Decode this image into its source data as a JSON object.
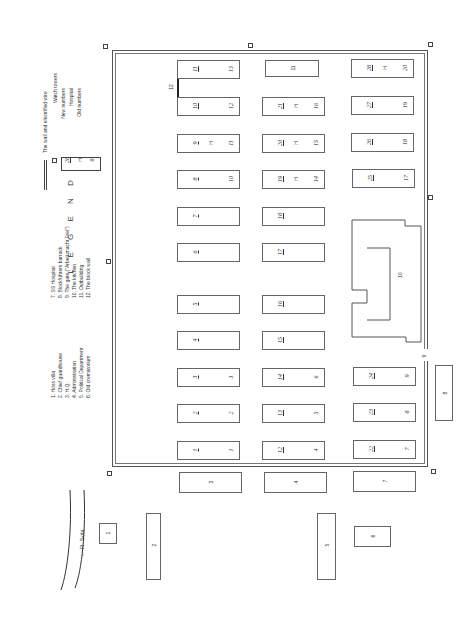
{
  "map": {
    "title": "L E G E N D",
    "river_label": "← R. Sola",
    "legend_items_left": [
      "1. Höss villa",
      "2. Chief guardhouse",
      "3. H.Q.",
      "4. Administration",
      "5. Political Department",
      "6. Old crematorium"
    ],
    "legend_items_right": [
      "7. SS Hospital",
      "8. Blockführers barrack",
      "9. The gate (\"Arbeit macht Frei\")",
      "10. The kitchen",
      "11. Outbuilding",
      "12. The block wall"
    ],
    "legend_symbols": {
      "wall": "The wall and electrified wire",
      "towers": "Watch towers",
      "new_numbers": "New numbers",
      "hospital": "Hospital",
      "old_numbers": "Old numbers",
      "sample_new": "28",
      "sample_h": "H",
      "sample_old": "8"
    },
    "camp_blocks": [
      {
        "new": "11",
        "old": "13",
        "h": ""
      },
      {
        "new": "10",
        "old": "12",
        "h": ""
      },
      {
        "new": "9",
        "old": "11",
        "h": "H"
      },
      {
        "new": "8",
        "old": "10",
        "h": ""
      },
      {
        "new": "7",
        "old": "",
        "h": ""
      },
      {
        "new": "6",
        "old": "",
        "h": ""
      },
      {
        "new": "5",
        "old": "",
        "h": ""
      },
      {
        "new": "4",
        "old": "",
        "h": ""
      },
      {
        "new": "3",
        "old": "3",
        "h": ""
      },
      {
        "new": "2",
        "old": "2",
        "h": ""
      },
      {
        "new": "1",
        "old": "1",
        "h": ""
      },
      {
        "new": "",
        "old": "",
        "h": "",
        "label": "11"
      },
      {
        "new": "21",
        "old": "16",
        "h": "H"
      },
      {
        "new": "20",
        "old": "15",
        "h": "H"
      },
      {
        "new": "19",
        "old": "14",
        "h": "H"
      },
      {
        "new": "18",
        "old": "",
        "h": ""
      },
      {
        "new": "17",
        "old": "",
        "h": ""
      },
      {
        "new": "16",
        "old": "",
        "h": ""
      },
      {
        "new": "15",
        "old": "",
        "h": ""
      },
      {
        "new": "14",
        "old": "6",
        "h": ""
      },
      {
        "new": "13",
        "old": "5",
        "h": ""
      },
      {
        "new": "12",
        "old": "4",
        "h": ""
      },
      {
        "new": "28",
        "old": "20",
        "h": "H"
      },
      {
        "new": "27",
        "old": "19",
        "h": ""
      },
      {
        "new": "26",
        "old": "18",
        "h": ""
      },
      {
        "new": "25",
        "old": "17",
        "h": ""
      },
      {
        "new": "24",
        "old": "9",
        "h": ""
      },
      {
        "new": "23",
        "old": "8",
        "h": ""
      },
      {
        "new": "22",
        "old": "7",
        "h": ""
      }
    ],
    "outside_buildings": {
      "b1": "1",
      "b2": "2",
      "b3": "3",
      "b4": "4",
      "b5": "5",
      "b6": "6",
      "b7": "7",
      "b8": "8"
    },
    "kitchen_label": "10",
    "gate_label": "9",
    "block_wall_label": "12"
  }
}
